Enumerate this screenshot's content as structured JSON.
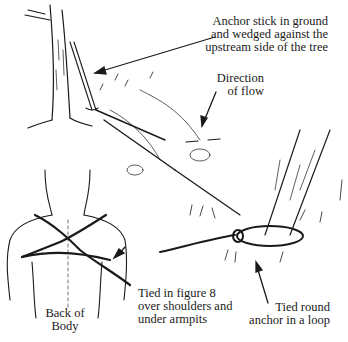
{
  "figure": {
    "type": "illustration",
    "labels": {
      "anchor_stick": [
        "Anchor stick in ground",
        "and wedged against the",
        "upstream side of the tree"
      ],
      "direction_of_flow": [
        "Direction",
        "of flow"
      ],
      "figure_8": [
        "Tied in figure 8",
        "over shoulders and",
        "under armpits"
      ],
      "back_of_body": [
        "Back of",
        "Body"
      ],
      "tied_round_anchor": [
        "Tied round",
        "anchor in a loop"
      ]
    },
    "colors": {
      "ink": "#1a1a1a",
      "background": "#ffffff"
    }
  }
}
